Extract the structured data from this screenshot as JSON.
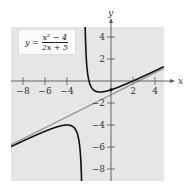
{
  "chart_data": {
    "type": "line",
    "title": "",
    "equation": {
      "lhs": "y =",
      "numerator": "x² − 4",
      "denominator": "2x + 5"
    },
    "xlabel": "x",
    "ylabel": "y",
    "xlim": [
      -9.1,
      4.8
    ],
    "ylim": [
      -9.1,
      4.9
    ],
    "x_ticks": [
      -8,
      -6,
      -4,
      2,
      4
    ],
    "y_ticks": [
      4,
      2,
      -2,
      -4,
      -6,
      -8
    ],
    "x_tick_labels": [
      "−8",
      "−6",
      "−4",
      "2",
      "4"
    ],
    "y_tick_labels": [
      "4",
      "2",
      "−2",
      "−4",
      "−6",
      "−8"
    ],
    "series": [
      {
        "name": "y = (x^2 - 4)/(2x + 5)",
        "kind": "function",
        "color": "#111111",
        "vertical_asymptote": -2.5,
        "sample_points": [
          [
            -9.1,
            -5.98
          ],
          [
            -8,
            -5.45
          ],
          [
            -6,
            -4.57
          ],
          [
            -5,
            -4.2
          ],
          [
            -4,
            -4.0
          ],
          [
            -3.5,
            -4.13
          ],
          [
            -3,
            -5.0
          ],
          [
            -2.8,
            -6.4
          ],
          [
            -2.7,
            -8.2
          ],
          [
            -2.4,
            48.0
          ],
          [
            -2.2,
            1.6
          ],
          [
            -2,
            0
          ],
          [
            -1.5,
            -0.875
          ],
          [
            -1,
            -1.0
          ],
          [
            0,
            -0.8
          ],
          [
            1,
            -0.43
          ],
          [
            2,
            0
          ],
          [
            3,
            0.45
          ],
          [
            4,
            0.92
          ],
          [
            4.8,
            1.35
          ]
        ]
      },
      {
        "name": "slant asymptote y = x/2 − 5/4",
        "kind": "line",
        "color": "#999999",
        "slope": 0.5,
        "intercept": -1.25
      }
    ],
    "grid": false,
    "legend": "none",
    "colors": {
      "plot_background": "#e6e6e6",
      "curve": "#111111",
      "asymptote": "#999999",
      "axis": "#555555"
    }
  }
}
